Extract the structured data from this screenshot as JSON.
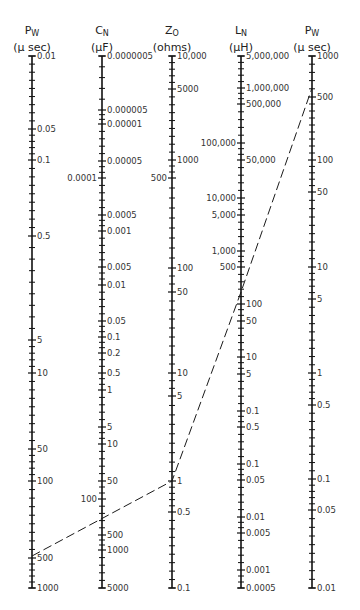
{
  "nomogram": {
    "top_y": 56,
    "bottom_y": 588,
    "axes": [
      {
        "id": "pw-left",
        "symbol": "P",
        "subscript": "W",
        "unit": "(μ sec)",
        "x": 32,
        "ticks": [
          {
            "label": "0.01",
            "y": 56,
            "side": "right"
          },
          {
            "label": "0.05",
            "y": 129,
            "side": "right"
          },
          {
            "label": "0.1",
            "y": 160,
            "side": "right"
          },
          {
            "label": "0.5",
            "y": 236,
            "side": "right"
          },
          {
            "label": "5",
            "y": 340,
            "side": "right"
          },
          {
            "label": "10",
            "y": 373,
            "side": "right"
          },
          {
            "label": "50",
            "y": 449,
            "side": "right"
          },
          {
            "label": "100",
            "y": 481,
            "side": "right"
          },
          {
            "label": "500",
            "y": 558,
            "side": "right"
          },
          {
            "label": "1000",
            "y": 588,
            "side": "right"
          }
        ]
      },
      {
        "id": "cn",
        "symbol": "C",
        "subscript": "N",
        "unit": "(μF)",
        "x": 102,
        "ticks": [
          {
            "label": "0.0000005",
            "y": 56,
            "side": "right"
          },
          {
            "label": "0.000005",
            "y": 110,
            "side": "right"
          },
          {
            "label": "0.00001",
            "y": 124,
            "side": "right"
          },
          {
            "label": "0.00005",
            "y": 161,
            "side": "right"
          },
          {
            "label": "0.0001",
            "y": 178,
            "side": "left"
          },
          {
            "label": "0.0005",
            "y": 215,
            "side": "right"
          },
          {
            "label": "0.001",
            "y": 231,
            "side": "right"
          },
          {
            "label": "0.005",
            "y": 267,
            "side": "right"
          },
          {
            "label": "0.01",
            "y": 285,
            "side": "right"
          },
          {
            "label": "0.05",
            "y": 321,
            "side": "right"
          },
          {
            "label": "0.1",
            "y": 337,
            "side": "right"
          },
          {
            "label": "0.2",
            "y": 353,
            "side": "right"
          },
          {
            "label": "0.5",
            "y": 373,
            "side": "right"
          },
          {
            "label": "1",
            "y": 390,
            "side": "right"
          },
          {
            "label": "5",
            "y": 427,
            "side": "right"
          },
          {
            "label": "10",
            "y": 444,
            "side": "right"
          },
          {
            "label": "50",
            "y": 481,
            "side": "right"
          },
          {
            "label": "100",
            "y": 499,
            "side": "left"
          },
          {
            "label": "500",
            "y": 535,
            "side": "right"
          },
          {
            "label": "1000",
            "y": 550,
            "side": "right"
          },
          {
            "label": "5000",
            "y": 588,
            "side": "right"
          }
        ]
      },
      {
        "id": "zo",
        "symbol": "Z",
        "subscript": "O",
        "unit": "(ohms)",
        "x": 172,
        "ticks": [
          {
            "label": "10,000",
            "y": 56,
            "side": "right"
          },
          {
            "label": "5000",
            "y": 89,
            "side": "right"
          },
          {
            "label": "1000",
            "y": 160,
            "side": "right"
          },
          {
            "label": "500",
            "y": 178,
            "side": "left"
          },
          {
            "label": "100",
            "y": 268,
            "side": "right"
          },
          {
            "label": "50",
            "y": 292,
            "side": "right"
          },
          {
            "label": "10",
            "y": 373,
            "side": "right"
          },
          {
            "label": "5",
            "y": 396,
            "side": "right"
          },
          {
            "label": "1",
            "y": 481,
            "side": "right"
          },
          {
            "label": "0.5",
            "y": 512,
            "side": "right"
          },
          {
            "label": "0.1",
            "y": 588,
            "side": "right"
          }
        ]
      },
      {
        "id": "ln",
        "symbol": "L",
        "subscript": "N",
        "unit": "(μH)",
        "x": 241,
        "ticks": [
          {
            "label": "5,000,000",
            "y": 56,
            "side": "right"
          },
          {
            "label": "1,000,000",
            "y": 88,
            "side": "right"
          },
          {
            "label": "500,000",
            "y": 104,
            "side": "right"
          },
          {
            "label": "100,000",
            "y": 143,
            "side": "left"
          },
          {
            "label": "50,000",
            "y": 160,
            "side": "right"
          },
          {
            "label": "10,000",
            "y": 198,
            "side": "left"
          },
          {
            "label": "5,000",
            "y": 215,
            "side": "left"
          },
          {
            "label": "1,000",
            "y": 251,
            "side": "left"
          },
          {
            "label": "500",
            "y": 267,
            "side": "left"
          },
          {
            "label": "100",
            "y": 304,
            "side": "right"
          },
          {
            "label": "50",
            "y": 321,
            "side": "right"
          },
          {
            "label": "10",
            "y": 357,
            "side": "right"
          },
          {
            "label": "5",
            "y": 374,
            "side": "right"
          },
          {
            "label": "0.1",
            "y": 411,
            "side": "right"
          },
          {
            "label": "0.5",
            "y": 427,
            "side": "right"
          },
          {
            "label": "0.1",
            "y": 464,
            "side": "right"
          },
          {
            "label": "0.05",
            "y": 480,
            "side": "right"
          },
          {
            "label": "0.01",
            "y": 517,
            "side": "right"
          },
          {
            "label": "0.005",
            "y": 533,
            "side": "right"
          },
          {
            "label": "0.001",
            "y": 570,
            "side": "right"
          },
          {
            "label": "0.0005",
            "y": 588,
            "side": "right"
          }
        ]
      },
      {
        "id": "pw-right",
        "symbol": "P",
        "subscript": "W",
        "unit": "(μ sec)",
        "x": 312,
        "ticks": [
          {
            "label": "1000",
            "y": 56,
            "side": "right"
          },
          {
            "label": "500",
            "y": 97,
            "side": "right"
          },
          {
            "label": "100",
            "y": 160,
            "side": "right"
          },
          {
            "label": "50",
            "y": 192,
            "side": "right"
          },
          {
            "label": "10",
            "y": 267,
            "side": "right"
          },
          {
            "label": "5",
            "y": 299,
            "side": "right"
          },
          {
            "label": "1",
            "y": 373,
            "side": "right"
          },
          {
            "label": "0.5",
            "y": 405,
            "side": "right"
          },
          {
            "label": "0.1",
            "y": 479,
            "side": "right"
          },
          {
            "label": "0.05",
            "y": 510,
            "side": "right"
          },
          {
            "label": "0.01",
            "y": 588,
            "side": "right"
          }
        ]
      }
    ],
    "example_line": {
      "style": "dashed",
      "points": [
        [
          32,
          556
        ],
        [
          172,
          481
        ],
        [
          241,
          292
        ],
        [
          312,
          88
        ]
      ]
    }
  }
}
